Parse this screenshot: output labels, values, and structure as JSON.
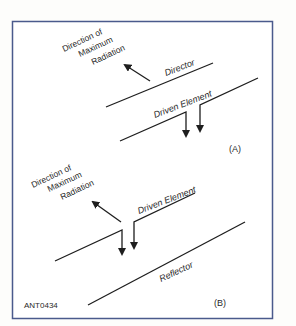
{
  "figure": {
    "id_label": "ANT0434",
    "border_color": "#4a5a8c",
    "line_color": "#1e1e1e",
    "panel_a": {
      "label": "(A)",
      "direction_text": [
        "Direction of",
        "Maximum",
        "Radiation"
      ],
      "director_label": "Director",
      "driven_label": "Driven Element"
    },
    "panel_b": {
      "label": "(B)",
      "direction_text": [
        "Direction of",
        "Maximum",
        "Radiation"
      ],
      "driven_label": "Driven Element",
      "reflector_label": "Reflector"
    }
  }
}
